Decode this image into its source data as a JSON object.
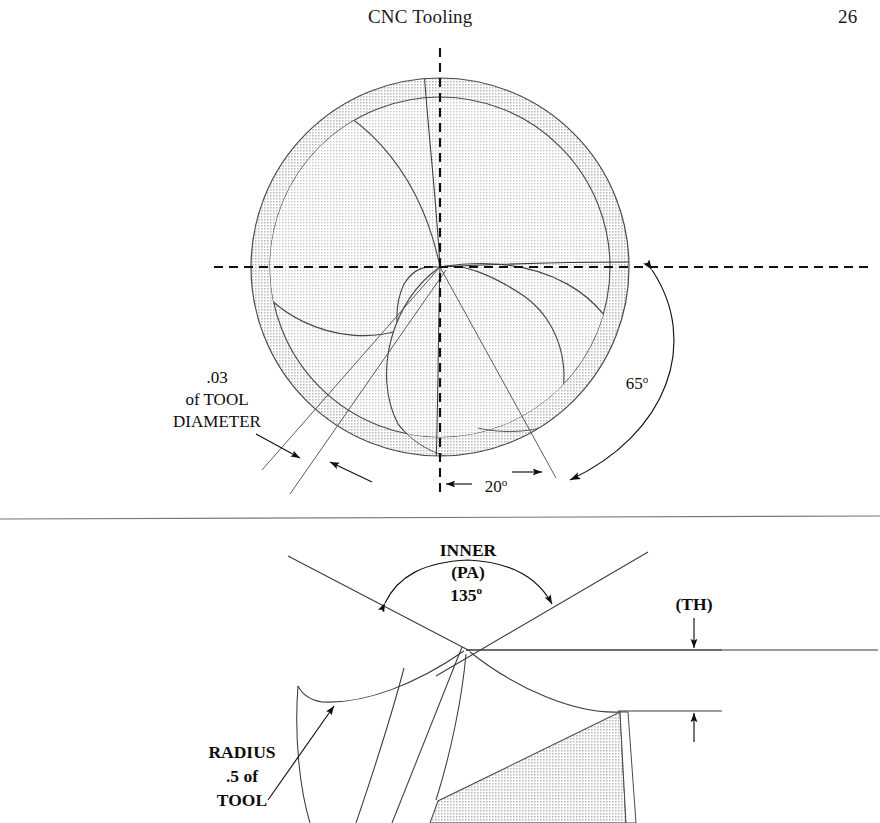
{
  "header": {
    "title": "CNC Tooling",
    "page_number": "26"
  },
  "figures": {
    "top": {
      "name": "end-view-of-tool",
      "annotations": {
        "tool_diameter": {
          "line1": ".03",
          "line2": "of TOOL",
          "line3": "DIAMETER"
        },
        "angle_20": "20",
        "angle_20_unit": "o",
        "angle_65": "65",
        "angle_65_unit": "o"
      }
    },
    "bottom": {
      "name": "side-view-of-tool-tip",
      "annotations": {
        "inner_pa": {
          "line1": "INNER",
          "line2": "(PA)",
          "line3": "135",
          "unit": "o"
        },
        "thickness": "(TH)",
        "radius": {
          "line1": "RADIUS",
          "line2": ".5  of",
          "line3": "TOOL"
        }
      }
    }
  },
  "colors": {
    "ink": "#111111",
    "line": "#3a3a3a",
    "hatch_fill": "#d8d8d8",
    "hatch_fill_light": "#e4e4e4",
    "divider": "#777777",
    "background": "#ffffff"
  }
}
